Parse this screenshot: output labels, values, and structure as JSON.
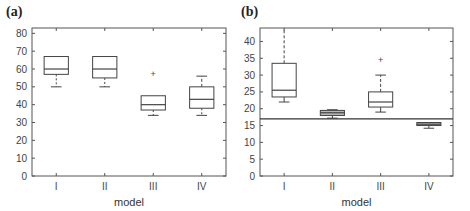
{
  "chart_data": [
    {
      "panel": "(a)",
      "type": "box",
      "xlabel": "model",
      "ylabel": "",
      "categories": [
        "I",
        "II",
        "III",
        "IV"
      ],
      "ylim": [
        0,
        83
      ],
      "yticks": [
        0,
        10,
        20,
        30,
        40,
        50,
        60,
        70,
        80
      ],
      "boxes": [
        {
          "category": "I",
          "whisker_low": 50,
          "q1": 57,
          "median": 60,
          "q3": 67,
          "whisker_high": 67,
          "outliers": [],
          "low_dashed": true,
          "high_dashed": false
        },
        {
          "category": "II",
          "whisker_low": 50,
          "q1": 55,
          "median": 60,
          "q3": 67,
          "whisker_high": 67,
          "outliers": [],
          "low_dashed": true,
          "high_dashed": false
        },
        {
          "category": "III",
          "whisker_low": 34,
          "q1": 37,
          "median": 40,
          "q3": 45,
          "whisker_high": 45,
          "outliers": [
            57
          ],
          "low_dashed": true,
          "high_dashed": false
        },
        {
          "category": "IV",
          "whisker_low": 34,
          "q1": 38,
          "median": 43,
          "q3": 50,
          "whisker_high": 56,
          "outliers": [],
          "low_dashed": true,
          "high_dashed": true
        }
      ],
      "reference_line": null,
      "grid": false
    },
    {
      "panel": "(b)",
      "type": "box",
      "xlabel": "model",
      "ylabel": "",
      "categories": [
        "I",
        "II",
        "III",
        "IV"
      ],
      "ylim": [
        0,
        44
      ],
      "yticks": [
        0,
        5,
        10,
        15,
        20,
        25,
        30,
        35,
        40
      ],
      "boxes": [
        {
          "category": "I",
          "whisker_low": 22,
          "q1": 23.5,
          "median": 25.5,
          "q3": 33.5,
          "whisker_high": 44,
          "outliers": [],
          "low_dashed": false,
          "high_dashed": true
        },
        {
          "category": "II",
          "whisker_low": 17.2,
          "q1": 18,
          "median": 18.8,
          "q3": 19.5,
          "whisker_high": 19.7,
          "outliers": [],
          "filled": true,
          "low_dashed": false,
          "high_dashed": false
        },
        {
          "category": "III",
          "whisker_low": 19,
          "q1": 20.5,
          "median": 22,
          "q3": 25,
          "whisker_high": 30,
          "outliers": [
            34.5
          ],
          "low_dashed": false,
          "high_dashed": true
        },
        {
          "category": "IV",
          "whisker_low": 14.2,
          "q1": 15,
          "median": 15.4,
          "q3": 15.9,
          "whisker_high": 15.9,
          "outliers": [],
          "filled": true,
          "low_dashed": false,
          "high_dashed": false
        }
      ],
      "reference_line": 17,
      "grid": false
    }
  ],
  "colors": {
    "axis": "#555555",
    "box_stroke": "#444444",
    "box_fill_gray": "#b8b8b8",
    "reference_line": "#333333",
    "text": "#444444"
  }
}
